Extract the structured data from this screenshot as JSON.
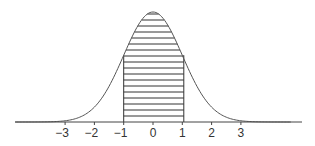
{
  "chart_data": {
    "type": "area",
    "title": "",
    "xlabel": "",
    "ylabel": "",
    "mean": 0,
    "sd": 1,
    "shaded_region": {
      "from": -1,
      "to": 1,
      "pattern": "horizontal-lines"
    },
    "x_ticks": [
      -3,
      -2,
      -1,
      0,
      1,
      2,
      3
    ],
    "x_tick_labels": [
      "−3",
      "−2",
      "−1",
      "0",
      "1",
      "2",
      "3"
    ],
    "xlim": [
      -4.7,
      5.2
    ],
    "grid": false,
    "legend": null
  },
  "colors": {
    "line": "#555555",
    "axis": "#444444",
    "hatch": "#333333",
    "text": "#333333"
  }
}
